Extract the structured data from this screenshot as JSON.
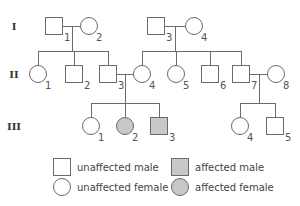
{
  "colors": {
    "line": "#6b6b6b",
    "unaffected_fill": "#ffffff",
    "affected_fill": "#c8c8c8"
  },
  "generations": [
    {
      "label": "I",
      "y": 26
    },
    {
      "label": "II",
      "y": 74
    },
    {
      "label": "III",
      "y": 126
    }
  ],
  "individuals": [
    {
      "id": "I-1",
      "gen": 0,
      "number": "1",
      "sex": "male",
      "affected": false,
      "x": 54
    },
    {
      "id": "I-2",
      "gen": 0,
      "number": "2",
      "sex": "female",
      "affected": false,
      "x": 89
    },
    {
      "id": "I-3",
      "gen": 0,
      "number": "3",
      "sex": "male",
      "affected": false,
      "x": 156
    },
    {
      "id": "I-4",
      "gen": 0,
      "number": "4",
      "sex": "female",
      "affected": false,
      "x": 194
    },
    {
      "id": "II-1",
      "gen": 1,
      "number": "1",
      "sex": "female",
      "affected": false,
      "x": 38
    },
    {
      "id": "II-2",
      "gen": 1,
      "number": "2",
      "sex": "male",
      "affected": false,
      "x": 74
    },
    {
      "id": "II-3",
      "gen": 1,
      "number": "3",
      "sex": "male",
      "affected": false,
      "x": 108
    },
    {
      "id": "II-4",
      "gen": 1,
      "number": "4",
      "sex": "female",
      "affected": false,
      "x": 142
    },
    {
      "id": "II-5",
      "gen": 1,
      "number": "5",
      "sex": "female",
      "affected": false,
      "x": 176
    },
    {
      "id": "II-6",
      "gen": 1,
      "number": "6",
      "sex": "male",
      "affected": false,
      "x": 210
    },
    {
      "id": "II-7",
      "gen": 1,
      "number": "7",
      "sex": "male",
      "affected": false,
      "x": 241
    },
    {
      "id": "II-8",
      "gen": 1,
      "number": "8",
      "sex": "female",
      "affected": false,
      "x": 276
    },
    {
      "id": "III-1",
      "gen": 2,
      "number": "1",
      "sex": "female",
      "affected": false,
      "x": 91
    },
    {
      "id": "III-2",
      "gen": 2,
      "number": "2",
      "sex": "female",
      "affected": true,
      "x": 125
    },
    {
      "id": "III-3",
      "gen": 2,
      "number": "3",
      "sex": "male",
      "affected": true,
      "x": 159
    },
    {
      "id": "III-4",
      "gen": 2,
      "number": "4",
      "sex": "female",
      "affected": false,
      "x": 240
    },
    {
      "id": "III-5",
      "gen": 2,
      "number": "5",
      "sex": "male",
      "affected": false,
      "x": 275
    }
  ],
  "matings": [
    {
      "a": "I-1",
      "b": "I-2",
      "children": [
        "II-1",
        "II-2",
        "II-3"
      ]
    },
    {
      "a": "I-3",
      "b": "I-4",
      "children": [
        "II-4",
        "II-5",
        "II-6",
        "II-7"
      ]
    },
    {
      "a": "II-3",
      "b": "II-4",
      "children": [
        "III-1",
        "III-2",
        "III-3"
      ]
    },
    {
      "a": "II-7",
      "b": "II-8",
      "children": [
        "III-4",
        "III-5"
      ]
    }
  ],
  "legend": [
    {
      "label": "unaffected male",
      "sex": "male",
      "affected": false,
      "x": 62,
      "y": 167
    },
    {
      "label": "unaffected female",
      "sex": "female",
      "affected": false,
      "x": 62,
      "y": 187
    },
    {
      "label": "affected male",
      "sex": "male",
      "affected": true,
      "x": 180,
      "y": 167
    },
    {
      "label": "affected female",
      "sex": "female",
      "affected": true,
      "x": 180,
      "y": 187
    }
  ]
}
